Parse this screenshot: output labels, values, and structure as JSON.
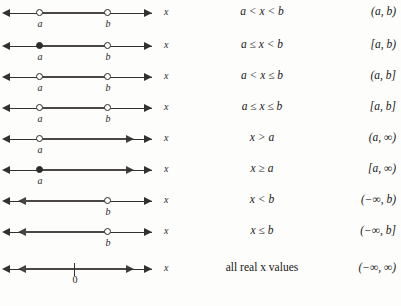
{
  "figure": {
    "axis_variable": "x",
    "zero_label": "0",
    "label_a": "a",
    "label_b": "b"
  },
  "rows": [
    {
      "id": "open-open",
      "inequality": "a < x < b",
      "interval": "(a, b)",
      "left_arrow": "left-arrow-icon",
      "right_arrow": "right-arrow-icon",
      "endpoints": [
        {
          "label": "a",
          "filled": false
        },
        {
          "label": "b",
          "filled": false
        }
      ]
    },
    {
      "id": "closed-open",
      "inequality": "a ≤ x < b",
      "interval": "[a, b)",
      "left_arrow": "left-arrow-icon",
      "right_arrow": "right-arrow-icon",
      "endpoints": [
        {
          "label": "a",
          "filled": true
        },
        {
          "label": "b",
          "filled": false
        }
      ]
    },
    {
      "id": "open-closed",
      "inequality": "a < x ≤ b",
      "interval": "(a, b]",
      "left_arrow": "left-arrow-icon",
      "right_arrow": "right-arrow-icon",
      "endpoints": [
        {
          "label": "a",
          "filled": false
        },
        {
          "label": "b",
          "filled": false
        }
      ]
    },
    {
      "id": "closed-closed",
      "inequality": "a ≤ x ≤ b",
      "interval": "[a, b]",
      "left_arrow": "left-arrow-icon",
      "right_arrow": "right-arrow-icon",
      "endpoints": [
        {
          "label": "a",
          "filled": false
        },
        {
          "label": "b",
          "filled": false
        }
      ]
    },
    {
      "id": "greater-than-a",
      "inequality": "x > a",
      "interval": "(a, ∞)",
      "left_arrow": "left-arrow-icon",
      "right_arrow": "right-arrow-icon",
      "endpoints": [
        {
          "label": "a",
          "filled": false
        }
      ]
    },
    {
      "id": "greater-equal-a",
      "inequality": "x ≥ a",
      "interval": "[a, ∞)",
      "left_arrow": "left-arrow-icon",
      "right_arrow": "right-arrow-icon",
      "endpoints": [
        {
          "label": "a",
          "filled": true
        }
      ]
    },
    {
      "id": "less-than-b",
      "inequality": "x < b",
      "interval": "(−∞, b)",
      "left_arrow": "left-arrow-icon",
      "right_arrow": "right-arrow-icon",
      "endpoints": [
        {
          "label": "b",
          "filled": false
        }
      ]
    },
    {
      "id": "less-equal-b",
      "inequality": "x ≤ b",
      "interval": "(−∞, b]",
      "left_arrow": "left-arrow-icon",
      "right_arrow": "right-arrow-icon",
      "endpoints": [
        {
          "label": "b",
          "filled": false
        }
      ]
    },
    {
      "id": "all-reals",
      "inequality": "all real x values",
      "inequality_plain": true,
      "interval": "(−∞, ∞)",
      "left_arrow": "left-arrow-icon",
      "right_arrow": "right-arrow-icon",
      "endpoints": []
    }
  ]
}
